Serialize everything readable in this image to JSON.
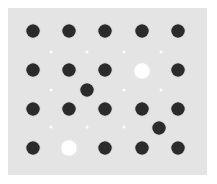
{
  "diagram": {
    "background_color": "#e4e4e4",
    "atom_color": "#2b2b2b",
    "vacancy_color": "#ffffff",
    "columns_x": [
      33,
      69,
      105,
      142,
      178
    ],
    "rows_y": [
      31,
      70,
      109,
      148
    ],
    "lattice_atoms": [
      {
        "x": 33,
        "y": 31
      },
      {
        "x": 69,
        "y": 31
      },
      {
        "x": 105,
        "y": 31
      },
      {
        "x": 142,
        "y": 31
      },
      {
        "x": 178,
        "y": 31
      },
      {
        "x": 33,
        "y": 70
      },
      {
        "x": 69,
        "y": 70
      },
      {
        "x": 105,
        "y": 70
      },
      {
        "x": 178,
        "y": 70
      },
      {
        "x": 33,
        "y": 109
      },
      {
        "x": 69,
        "y": 109
      },
      {
        "x": 105,
        "y": 109
      },
      {
        "x": 142,
        "y": 109
      },
      {
        "x": 178,
        "y": 109
      },
      {
        "x": 33,
        "y": 148
      },
      {
        "x": 105,
        "y": 148
      },
      {
        "x": 142,
        "y": 148
      },
      {
        "x": 178,
        "y": 148
      }
    ],
    "vacancies": [
      {
        "x": 142,
        "y": 71
      },
      {
        "x": 69,
        "y": 148
      }
    ],
    "interstitial_atoms": [
      {
        "x": 87,
        "y": 90
      },
      {
        "x": 159,
        "y": 128
      }
    ],
    "interstitial_sites": [
      {
        "x": 51,
        "y": 52
      },
      {
        "x": 87,
        "y": 52
      },
      {
        "x": 124,
        "y": 52
      },
      {
        "x": 161,
        "y": 52
      },
      {
        "x": 51,
        "y": 90
      },
      {
        "x": 124,
        "y": 90
      },
      {
        "x": 161,
        "y": 90
      },
      {
        "x": 51,
        "y": 127
      },
      {
        "x": 87,
        "y": 127
      },
      {
        "x": 124,
        "y": 127
      }
    ]
  }
}
